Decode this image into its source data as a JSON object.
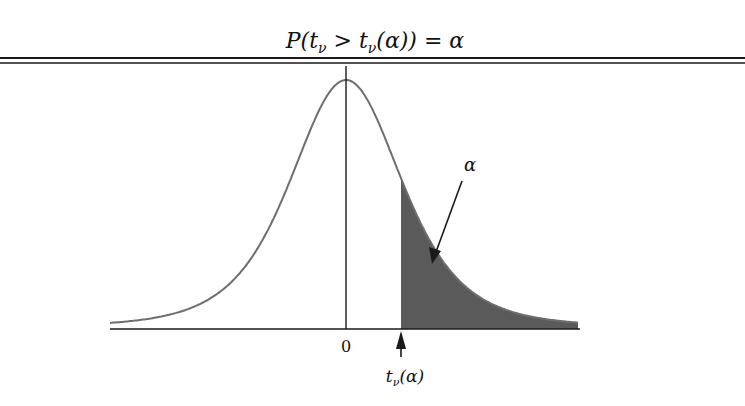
{
  "labels": {
    "zero_tick": "0",
    "critical_value": "t_ν(α)",
    "area_label": "α"
  },
  "colors": {
    "curve": "#6e6e6e",
    "shade": "#5a5a5a",
    "axis": "#1a1a1a",
    "rule": "#1a1a1a",
    "background": "#ffffff"
  },
  "chart_data": {
    "type": "area",
    "x_ticks": [
      "0",
      "t_ν(α)"
    ],
    "shaded_region": {
      "from": "t_ν(α)",
      "to": "+∞",
      "area": "α"
    },
    "annotations": [
      "α (arrow pointing to shaded tail)",
      "arrow pointing up at t_ν(α)"
    ],
    "grid": false,
    "legend": null
  }
}
